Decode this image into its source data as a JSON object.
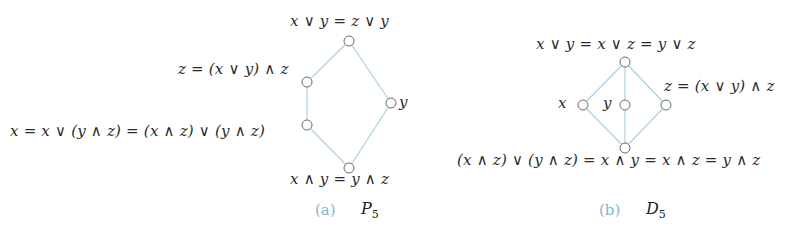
{
  "colors": {
    "edge": "#a9d2e4",
    "node_stroke": "#6b6b6b",
    "node_fill": "#ffffff",
    "caption_tag": "#7fb6d8",
    "text": "#2a2a2a"
  },
  "diagrams": [
    {
      "id": "P5",
      "caption": {
        "tag": "(a)",
        "name": "P",
        "subscript": "5"
      },
      "nodes": [
        {
          "id": "top",
          "x": 349,
          "y": 41,
          "label": "x ∨ y = z ∨ y"
        },
        {
          "id": "z",
          "x": 307,
          "y": 82,
          "label": "z = (x ∨ y) ∧ z"
        },
        {
          "id": "x",
          "x": 307,
          "y": 125,
          "label": "x = x ∨ (y ∧ z)  = (x ∧ z) ∨ (y ∧ z)"
        },
        {
          "id": "y",
          "x": 391,
          "y": 103,
          "label": "y"
        },
        {
          "id": "bottom",
          "x": 349,
          "y": 168,
          "label": "x ∧ y = y ∧ z"
        }
      ],
      "edges": [
        [
          "top",
          "z"
        ],
        [
          "z",
          "x"
        ],
        [
          "x",
          "bottom"
        ],
        [
          "top",
          "y"
        ],
        [
          "y",
          "bottom"
        ]
      ]
    },
    {
      "id": "D5",
      "caption": {
        "tag": "(b)",
        "name": "D",
        "subscript": "5"
      },
      "nodes": [
        {
          "id": "top",
          "x": 625,
          "y": 62,
          "label": "x ∨ y = x ∨ z = y ∨ z"
        },
        {
          "id": "x",
          "x": 583,
          "y": 105,
          "label": "x"
        },
        {
          "id": "y",
          "x": 625,
          "y": 105,
          "label": "y"
        },
        {
          "id": "z",
          "x": 666,
          "y": 105,
          "label": "z = (x ∨ y) ∧ z"
        },
        {
          "id": "bottom",
          "x": 625,
          "y": 148,
          "label": "(x ∧ z) ∨ (y ∧ z) =  x ∧ y = x ∧ z = y ∧ z"
        }
      ],
      "edges": [
        [
          "top",
          "x"
        ],
        [
          "top",
          "y"
        ],
        [
          "top",
          "z"
        ],
        [
          "x",
          "bottom"
        ],
        [
          "y",
          "bottom"
        ],
        [
          "z",
          "bottom"
        ]
      ]
    }
  ]
}
